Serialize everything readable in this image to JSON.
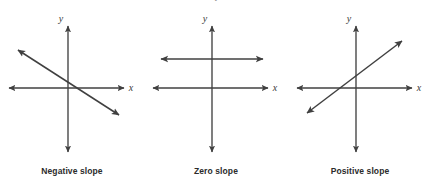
{
  "figure": {
    "title_fragment_clipped": "y",
    "stroke_color": "#404040",
    "caption_color": "#2b2b2b",
    "axis_label_color": "#3a3a3a",
    "background": "#ffffff",
    "panels": [
      {
        "caption": "Negative slope",
        "y_axis_label": "y",
        "x_axis_label": "x",
        "line_kind": "negative-slope-line",
        "slope_sign": "negative"
      },
      {
        "caption": "Zero slope",
        "y_axis_label": "y",
        "x_axis_label": "x",
        "line_kind": "zero-slope-line",
        "slope_sign": "zero"
      },
      {
        "caption": "Positive slope",
        "y_axis_label": "y",
        "x_axis_label": "x",
        "line_kind": "positive-slope-line",
        "slope_sign": "positive"
      }
    ]
  }
}
